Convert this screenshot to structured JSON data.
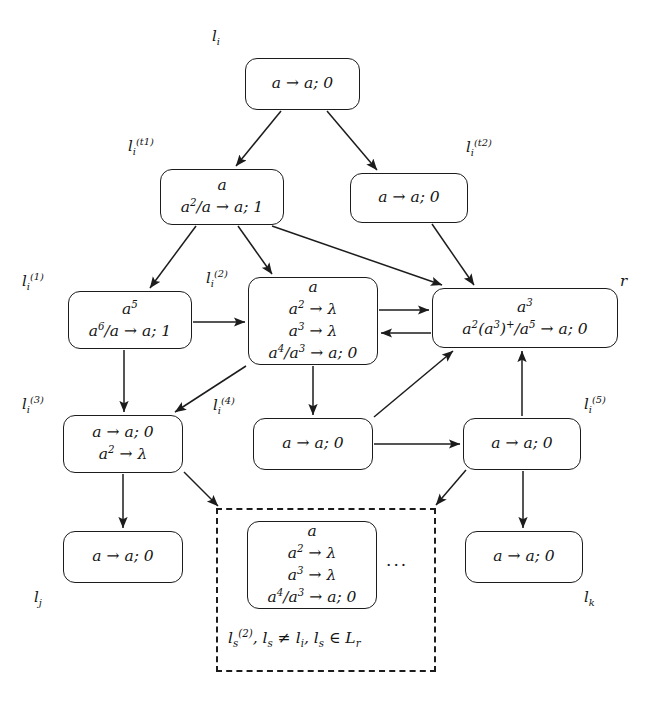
{
  "figure": {
    "type": "diagram",
    "width": 650,
    "height": 706,
    "background": "#ffffff",
    "stroke": "#1c1c1c"
  },
  "nodes": [
    {
      "id": "li",
      "label": "l_i",
      "label_html": "l<sub>i</sub>",
      "label_pos": "top-left",
      "lines": [
        "a → a; 0"
      ],
      "lines_html": [
        "a → a; 0"
      ],
      "x": 245,
      "y": 58,
      "w": 115,
      "h": 52
    },
    {
      "id": "li_t1",
      "label": "l_i^(t1)",
      "label_html": "l<sub>i</sub><sup>(t1)</sup>",
      "label_pos": "top-left",
      "lines": [
        "a",
        "a^2/a → a; 1"
      ],
      "lines_html": [
        "a",
        "a<sup>2</sup>/a → a; 1"
      ],
      "x": 160,
      "y": 169,
      "w": 124,
      "h": 56
    },
    {
      "id": "li_t2",
      "label": "l_i^(t2)",
      "label_html": "l<sub>i</sub><sup>(t2)</sup>",
      "label_pos": "top-right",
      "lines": [
        "a → a; 0"
      ],
      "lines_html": [
        "a → a; 0"
      ],
      "x": 350,
      "y": 173,
      "w": 118,
      "h": 50
    },
    {
      "id": "li_1",
      "label": "l_i^(1)",
      "label_html": "l<sub>i</sub><sup>(1)</sup>",
      "label_pos": "top-left",
      "lines": [
        "a^5",
        "a^6/a → a; 1"
      ],
      "lines_html": [
        "a<sup>5</sup>",
        "a<sup>6</sup>/a → a; 1"
      ],
      "x": 68,
      "y": 291,
      "w": 124,
      "h": 58
    },
    {
      "id": "li_2",
      "label": "l_i^(2)",
      "label_html": "l<sub>i</sub><sup>(2)</sup>",
      "label_pos": "top-left",
      "lines": [
        "a",
        "a^2 → λ",
        "a^3 → λ",
        "a^4/a^3 → a; 0"
      ],
      "lines_html": [
        "a",
        "a<sup>2</sup> → λ",
        "a<sup>3</sup> → λ",
        "a<sup>4</sup>/a<sup>3</sup> → a; 0"
      ],
      "x": 248,
      "y": 277,
      "w": 130,
      "h": 88
    },
    {
      "id": "r",
      "label": "r",
      "label_html": "r",
      "label_pos": "top-right",
      "lines": [
        "a^3",
        "a^2(a^3)^+/a^5 → a; 0"
      ],
      "lines_html": [
        "a<sup>3</sup>",
        "a<sup>2</sup>(a<sup>3</sup>)<sup>+</sup>/a<sup>5</sup> → a; 0"
      ],
      "x": 432,
      "y": 288,
      "w": 186,
      "h": 60
    },
    {
      "id": "li_3",
      "label": "l_i^(3)",
      "label_html": "l<sub>i</sub><sup>(3)</sup>",
      "label_pos": "top-left",
      "lines": [
        "a → a; 0",
        "a^2 → λ"
      ],
      "lines_html": [
        "a → a; 0",
        "a<sup>2</sup> → λ"
      ],
      "x": 63,
      "y": 415,
      "w": 120,
      "h": 58
    },
    {
      "id": "li_4",
      "label": "l_i^(4)",
      "label_html": "l<sub>i</sub><sup>(4)</sup>",
      "label_pos": "top-left",
      "lines": [
        "a → a; 0"
      ],
      "lines_html": [
        "a → a; 0"
      ],
      "x": 253,
      "y": 418,
      "w": 120,
      "h": 52
    },
    {
      "id": "li_5",
      "label": "l_i^(5)",
      "label_html": "l<sub>i</sub><sup>(5)</sup>",
      "label_pos": "top-right",
      "lines": [
        "a → a; 0"
      ],
      "lines_html": [
        "a → a; 0"
      ],
      "x": 463,
      "y": 418,
      "w": 118,
      "h": 52
    },
    {
      "id": "lj",
      "label": "l_j",
      "label_html": "l<sub>j</sub>",
      "label_pos": "bottom-left",
      "lines": [
        "a → a; 0"
      ],
      "lines_html": [
        "a → a; 0"
      ],
      "x": 63,
      "y": 531,
      "w": 120,
      "h": 52
    },
    {
      "id": "lk",
      "label": "l_k",
      "label_html": "l<sub>k</sub>",
      "label_pos": "bottom-right",
      "lines": [
        "a → a; 0"
      ],
      "lines_html": [
        "a → a; 0"
      ],
      "x": 465,
      "y": 531,
      "w": 118,
      "h": 52
    },
    {
      "id": "ls_2",
      "label": "",
      "label_html": "",
      "label_pos": "none",
      "lines": [
        "a",
        "a^2 → λ",
        "a^3 → λ",
        "a^4/a^3 → a; 0"
      ],
      "lines_html": [
        "a",
        "a<sup>2</sup> → λ",
        "a<sup>3</sup> → λ",
        "a<sup>4</sup>/a<sup>3</sup> → a; 0"
      ],
      "x": 247,
      "y": 521,
      "w": 130,
      "h": 88
    }
  ],
  "dashed_group": {
    "x": 216,
    "y": 508,
    "w": 220,
    "h": 164,
    "ellipsis": "···",
    "caption": "l_s^(2), l_s ≠ l_i, l_s ∈ L_r",
    "caption_html": "l<sub>s</sub><sup>(2)</sup>, l<sub>s</sub> ≠ l<sub>i</sub>, l<sub>s</sub> ∈ L<sub>r</sub>"
  },
  "edges": [
    {
      "from": "li",
      "to": "li_t1",
      "kind": "arrow"
    },
    {
      "from": "li",
      "to": "li_t2",
      "kind": "arrow"
    },
    {
      "from": "li_t1",
      "to": "li_1",
      "kind": "arrow"
    },
    {
      "from": "li_t1",
      "to": "li_2",
      "kind": "arrow"
    },
    {
      "from": "li_t1",
      "to": "r",
      "kind": "arrow"
    },
    {
      "from": "li_t2",
      "to": "r",
      "kind": "arrow"
    },
    {
      "from": "li_1",
      "to": "li_2",
      "kind": "arrow"
    },
    {
      "from": "li_1",
      "to": "li_3",
      "kind": "arrow"
    },
    {
      "from": "li_2",
      "to": "r",
      "kind": "arrow"
    },
    {
      "from": "r",
      "to": "li_2",
      "kind": "arrow"
    },
    {
      "from": "li_2",
      "to": "li_3",
      "kind": "arrow"
    },
    {
      "from": "li_2",
      "to": "li_4",
      "kind": "arrow"
    },
    {
      "from": "li_4",
      "to": "r",
      "kind": "arrow"
    },
    {
      "from": "li_4",
      "to": "li_5",
      "kind": "arrow"
    },
    {
      "from": "li_5",
      "to": "r",
      "kind": "arrow"
    },
    {
      "from": "li_3",
      "to": "lj",
      "kind": "arrow"
    },
    {
      "from": "li_3",
      "to": "dashed_group",
      "kind": "arrow"
    },
    {
      "from": "li_5",
      "to": "lk",
      "kind": "arrow"
    },
    {
      "from": "li_5",
      "to": "dashed_group",
      "kind": "arrow"
    }
  ]
}
